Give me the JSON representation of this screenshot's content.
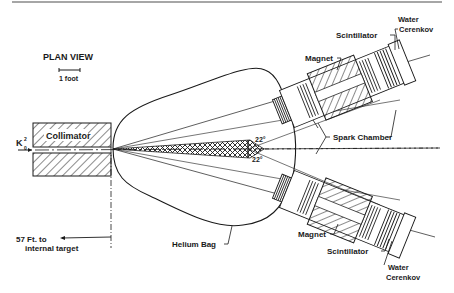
{
  "diagram": {
    "title": "PLAN VIEW",
    "scale_label": "1 foot",
    "beam_label": "K",
    "beam_sup": "0",
    "beam_sub": "2",
    "labels": {
      "collimator": "Collimator",
      "distance_line1": "57 Ft. to",
      "distance_line2": "internal target",
      "helium_bag": "Helium Bag",
      "spark_chamber": "Spark Chamber",
      "magnet_top": "Magnet",
      "magnet_bottom": "Magnet",
      "scintillator_top": "Scintillator",
      "scintillator_bottom": "Scintillator",
      "water_top_1": "Water",
      "water_top_2": "Cerenkov",
      "water_bottom_1": "Water",
      "water_bottom_2": "Cerenkov",
      "angle_top": "22°",
      "angle_bottom": "22°"
    },
    "colors": {
      "ink": "#1a1a1a",
      "background": "#ffffff",
      "rule": "#888888"
    }
  }
}
